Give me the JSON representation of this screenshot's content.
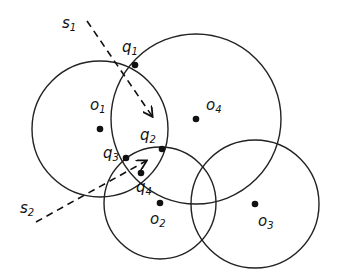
{
  "diagram": {
    "type": "circle-intersection-geometry",
    "circles": [
      {
        "id": "o1",
        "label": "o",
        "sub": "1",
        "cx": 100,
        "cy": 129,
        "r": 68,
        "lx": 90,
        "ly": 110
      },
      {
        "id": "o2",
        "label": "o",
        "sub": "2",
        "cx": 160,
        "cy": 203,
        "r": 56,
        "lx": 150,
        "ly": 224
      },
      {
        "id": "o3",
        "label": "o",
        "sub": "3",
        "cx": 255,
        "cy": 204,
        "r": 64,
        "lx": 258,
        "ly": 226
      },
      {
        "id": "o4",
        "label": "o",
        "sub": "4",
        "cx": 196,
        "cy": 119,
        "r": 85,
        "lx": 206,
        "ly": 110
      }
    ],
    "points": [
      {
        "id": "q1",
        "label": "q",
        "sub": "1",
        "x": 135,
        "y": 65,
        "lx": 122,
        "ly": 52
      },
      {
        "id": "q2",
        "label": "q",
        "sub": "2",
        "x": 162,
        "y": 149,
        "lx": 140,
        "ly": 140
      },
      {
        "id": "q3",
        "label": "q",
        "sub": "3",
        "x": 126,
        "y": 158,
        "lx": 103,
        "ly": 158
      },
      {
        "id": "q4",
        "label": "q",
        "sub": "4",
        "x": 141,
        "y": 173,
        "lx": 136,
        "ly": 192
      }
    ],
    "segments": [
      {
        "id": "s1",
        "label": "s",
        "sub": "1",
        "x1": 87,
        "y1": 21,
        "x2": 152,
        "y2": 116,
        "lx": 62,
        "ly": 28
      },
      {
        "id": "s2",
        "label": "s",
        "sub": "2",
        "x1": 36,
        "y1": 222,
        "x2": 146,
        "y2": 161,
        "lx": 20,
        "ly": 213
      }
    ]
  }
}
